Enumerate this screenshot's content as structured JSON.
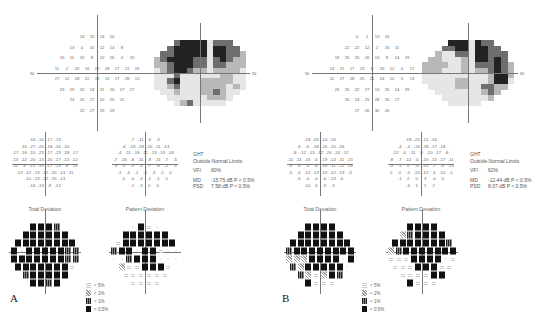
{
  "panels": [
    {
      "letter": "A",
      "offset_x": 0,
      "threshold": {
        "center": [
          97,
          73
        ],
        "axis_label_left": "30",
        "axis_label_right": "30",
        "rows": [
          [
            "14",
            "15",
            "14",
            "20"
          ],
          [
            "13",
            "4",
            "10",
            "12",
            "14",
            "8"
          ],
          [
            "15",
            "11",
            "15",
            "8",
            "12",
            "26",
            "4",
            "15"
          ],
          [
            "11",
            "2",
            "20",
            "16",
            "20",
            "18",
            "17",
            "21",
            "15"
          ],
          [
            "27",
            "12",
            "28",
            "22",
            "19",
            "15",
            "17",
            "28",
            "13"
          ],
          [
            "23",
            "19",
            "20",
            "24",
            "21",
            "16",
            "17",
            "27"
          ],
          [
            "24",
            "26",
            "27",
            "20",
            "25",
            "21"
          ],
          [
            "22",
            "27",
            "25",
            "29"
          ]
        ]
      },
      "grayscale": {
        "center": [
          200,
          73
        ],
        "levels": [
          [
            0,
            0,
            0,
            3,
            4,
            4,
            4,
            4,
            1,
            3,
            3,
            3,
            0,
            0
          ],
          [
            0,
            0,
            3,
            4,
            4,
            4,
            4,
            4,
            1,
            4,
            4,
            3,
            3,
            0
          ],
          [
            0,
            3,
            3,
            4,
            4,
            4,
            4,
            4,
            1,
            4,
            4,
            3,
            3,
            2
          ],
          [
            2,
            3,
            4,
            4,
            4,
            4,
            3,
            3,
            1,
            3,
            4,
            3,
            2,
            2
          ],
          [
            2,
            2,
            3,
            4,
            4,
            4,
            3,
            3,
            1,
            3,
            3,
            2,
            2,
            2
          ],
          [
            1,
            2,
            3,
            4,
            4,
            3,
            2,
            2,
            1,
            2,
            2,
            2,
            2,
            1
          ],
          [
            1,
            1,
            1,
            3,
            1,
            1,
            1,
            1,
            1,
            1,
            2,
            2,
            1,
            1
          ],
          [
            1,
            1,
            3,
            4,
            1,
            1,
            1,
            2,
            2,
            2,
            2,
            2,
            1,
            1
          ],
          [
            1,
            1,
            2,
            3,
            1,
            1,
            1,
            2,
            2,
            2,
            2,
            1,
            2,
            1
          ],
          [
            0,
            1,
            1,
            2,
            1,
            1,
            1,
            2,
            2,
            3,
            2,
            1,
            1,
            0
          ],
          [
            0,
            0,
            1,
            1,
            1,
            1,
            1,
            1,
            2,
            2,
            2,
            1,
            0,
            0
          ],
          [
            0,
            0,
            0,
            1,
            2,
            3,
            1,
            1,
            1,
            1,
            1,
            0,
            0,
            0
          ]
        ]
      },
      "total_deviation_values": {
        "center": [
          45,
          162
        ],
        "rows": [
          [
            "-16",
            "-16",
            "-17",
            "-13"
          ],
          [
            "-16",
            "-27",
            "-20",
            "-18",
            "-16",
            "-20"
          ],
          [
            "-17",
            "-18",
            "-15",
            "-23",
            "-17",
            "-23",
            "-28",
            "-17"
          ],
          [
            "-15",
            "-22",
            "-20",
            "-13",
            "-20",
            "-17",
            "-13",
            "-12"
          ],
          [
            "-11",
            "-9",
            "-13",
            "-15",
            "-17",
            "-13",
            "-8",
            "-11"
          ],
          [
            "-13",
            "-12",
            "-13",
            "-12",
            "-20",
            "-13",
            "-11"
          ],
          [
            "-10",
            "-13",
            "-12",
            "-15",
            "-13"
          ],
          [
            "-16",
            "-13",
            "-8",
            "-12"
          ]
        ]
      },
      "pattern_deviation_values": {
        "center": [
          145,
          162
        ],
        "rows": [
          [
            "-7",
            "-11",
            "-6",
            "-3"
          ],
          [
            "-6",
            "-19",
            "-18",
            "-20",
            "-11",
            "-13"
          ],
          [
            "-4",
            "-11",
            "-18",
            "-11",
            "-13",
            "-19",
            "-18"
          ],
          [
            "-7",
            "-16",
            "-8",
            "-11",
            "-8",
            "-11",
            "-7",
            "-3"
          ],
          [
            "-3",
            "0",
            "-5",
            "-4",
            "-7",
            "-8",
            "-2",
            "-3"
          ],
          [
            "-1",
            "-4",
            "-1",
            "-3",
            "-3",
            "-1",
            "0"
          ],
          [
            "0",
            "-4",
            "-3",
            "-2",
            "-1",
            "-1"
          ],
          [
            "-1",
            "-3",
            "0",
            "0"
          ]
        ]
      },
      "total_deviation_label": "Total Deviation",
      "pattern_deviation_label": "Pattern Deviation",
      "total_deviation_symbols": {
        "center": [
          45,
          255
        ],
        "rows": [
          [
            4,
            4,
            4,
            3
          ],
          [
            4,
            4,
            4,
            4,
            4,
            4
          ],
          [
            4,
            4,
            4,
            4,
            4,
            4,
            4,
            4
          ],
          [
            4,
            0,
            4,
            4,
            4,
            4,
            4,
            3,
            3
          ],
          [
            4,
            4,
            4,
            4,
            4,
            4,
            4,
            3,
            3
          ],
          [
            4,
            4,
            4,
            4,
            4,
            4,
            4,
            1
          ],
          [
            3,
            4,
            4,
            4,
            4,
            4
          ],
          [
            4,
            4,
            3,
            4
          ]
        ]
      },
      "pattern_deviation_symbols": {
        "center": [
          145,
          255
        ],
        "rows": [
          [
            0,
            4,
            1,
            0
          ],
          [
            4,
            4,
            4,
            4,
            4,
            4
          ],
          [
            1,
            4,
            4,
            4,
            4,
            4,
            4,
            4
          ],
          [
            3,
            4,
            4,
            0,
            4,
            4,
            1,
            0,
            0
          ],
          [
            0,
            0,
            3,
            4,
            4,
            4,
            0,
            0,
            0
          ],
          [
            2,
            1,
            1,
            4,
            4,
            4,
            1
          ],
          [
            1,
            1,
            1,
            1,
            1,
            1
          ],
          [
            1,
            1,
            1,
            1
          ]
        ]
      },
      "stats": {
        "ght_label": "GHT",
        "ght_value": "Outside Normal Limits",
        "vfi_label": "VFI",
        "vfi_value": "60%",
        "md_label": "MD",
        "md_value": "-15.75 dB P < 0.5%",
        "psd_label": "PSD",
        "psd_value": "7.58 dB  P < 0.5%"
      },
      "stats_pos": [
        193,
        151
      ],
      "legend_pos": [
        86,
        281
      ]
    },
    {
      "letter": "B",
      "offset_x": 0,
      "threshold": {
        "center": [
          372,
          73
        ],
        "axis_label_left": "30",
        "axis_label_right": "30",
        "rows": [
          [
            "0",
            "1",
            "13",
            "16"
          ],
          [
            "22",
            "22",
            "12",
            "2",
            "15",
            "11"
          ],
          [
            "19",
            "26",
            "26",
            "26",
            "13",
            "8",
            "14",
            "19"
          ],
          [
            "14",
            "21",
            "17",
            "23",
            "8",
            "20",
            "12",
            "4",
            "17"
          ],
          [
            "22",
            "27",
            "28",
            "25",
            "21",
            "24",
            "22",
            "5",
            "13"
          ],
          [
            "25",
            "26",
            "22",
            "27",
            "13",
            "26",
            "14",
            "29"
          ],
          [
            "26",
            "24",
            "25",
            "28",
            "26",
            "27"
          ],
          [
            "27",
            "26",
            "30",
            "26"
          ]
        ]
      },
      "grayscale": {
        "center": [
          468,
          73
        ],
        "levels": [
          [
            0,
            0,
            0,
            0,
            4,
            4,
            4,
            1,
            4,
            3,
            3,
            0,
            0,
            0
          ],
          [
            0,
            0,
            0,
            3,
            3,
            4,
            4,
            1,
            4,
            4,
            3,
            3,
            0,
            0
          ],
          [
            0,
            0,
            2,
            1,
            1,
            3,
            3,
            1,
            4,
            4,
            3,
            3,
            3,
            0
          ],
          [
            0,
            2,
            2,
            1,
            1,
            1,
            2,
            1,
            4,
            4,
            3,
            4,
            3,
            0
          ],
          [
            2,
            2,
            2,
            2,
            1,
            1,
            2,
            1,
            3,
            3,
            3,
            4,
            3,
            2
          ],
          [
            2,
            2,
            2,
            1,
            1,
            1,
            2,
            1,
            2,
            2,
            3,
            4,
            3,
            2
          ],
          [
            1,
            1,
            1,
            1,
            1,
            1,
            1,
            1,
            1,
            1,
            2,
            4,
            4,
            2
          ],
          [
            1,
            1,
            1,
            1,
            1,
            2,
            2,
            1,
            1,
            1,
            2,
            4,
            4,
            1
          ],
          [
            0,
            1,
            1,
            1,
            1,
            2,
            2,
            1,
            1,
            3,
            3,
            2,
            2,
            0
          ],
          [
            0,
            0,
            1,
            1,
            1,
            1,
            1,
            1,
            1,
            2,
            3,
            2,
            0,
            0
          ],
          [
            0,
            0,
            0,
            1,
            1,
            1,
            1,
            1,
            1,
            1,
            2,
            0,
            0,
            0
          ],
          [
            0,
            0,
            0,
            0,
            1,
            1,
            1,
            1,
            1,
            0,
            0,
            0,
            0,
            0
          ]
        ]
      },
      "total_deviation_values": {
        "center": [
          320,
          162
        ],
        "rows": [
          [
            "-18",
            "-26",
            "-14",
            "-16"
          ],
          [
            "-5",
            "-6",
            "-18",
            "-26",
            "-15",
            "-26"
          ],
          [
            "-8",
            "-12",
            "-13",
            "-12",
            "-26",
            "-24",
            "-12"
          ],
          [
            "-11",
            "-11",
            "-16",
            "-6",
            "-19",
            "-14",
            "-11",
            "-15"
          ],
          [
            "-6",
            "-6",
            "-4",
            "-6",
            "-10",
            "-11",
            "-12",
            "-26"
          ],
          [
            "-5",
            "-6",
            "-12",
            "-13",
            "-16",
            "-12",
            "-13",
            "-3"
          ],
          [
            "-5",
            "-4",
            "-4",
            "-6",
            "-13",
            "-6"
          ],
          [
            "-10",
            "-5",
            "-5",
            "-3"
          ]
        ]
      },
      "pattern_deviation_values": {
        "center": [
          421,
          162
        ],
        "rows": [
          [
            "-18",
            "-20",
            "-12",
            "-16"
          ],
          [
            "-4",
            "-4",
            "-16",
            "-28",
            "-17",
            "-18"
          ],
          [
            "-12",
            "-4",
            "-11",
            "-8",
            "-20",
            "-17",
            "-8"
          ],
          [
            "-8",
            "-7",
            "-12",
            "-6",
            "-15",
            "-15",
            "-17",
            "-11"
          ],
          [
            "-4",
            "-1",
            "0",
            "-6",
            "-10",
            "-7",
            "-6",
            "-15"
          ],
          [
            "0",
            "0",
            "-5",
            "-10",
            "-12",
            "-6",
            "-10",
            "-1"
          ],
          [
            "-1",
            "2",
            "0",
            "3",
            "-4",
            "-5"
          ],
          [
            "-6",
            "1",
            "1",
            "2"
          ]
        ]
      },
      "total_deviation_label": "Total Deviation",
      "pattern_deviation_label": "Pattern Deviation",
      "total_deviation_symbols": {
        "center": [
          320,
          255
        ],
        "rows": [
          [
            4,
            4,
            4,
            4
          ],
          [
            4,
            4,
            4,
            4,
            4,
            4
          ],
          [
            4,
            4,
            4,
            4,
            4,
            4,
            4,
            4
          ],
          [
            3,
            4,
            4,
            4,
            4,
            4,
            4,
            4,
            4
          ],
          [
            2,
            2,
            2,
            4,
            4,
            4,
            4,
            0,
            4
          ],
          [
            3,
            2,
            4,
            4,
            4,
            4,
            4,
            0
          ],
          [
            3,
            2,
            1,
            2,
            4,
            3
          ],
          [
            4,
            1,
            1,
            1
          ]
        ]
      },
      "pattern_deviation_symbols": {
        "center": [
          422,
          255
        ],
        "rows": [
          [
            4,
            4,
            4,
            4
          ],
          [
            2,
            3,
            4,
            4,
            4,
            4
          ],
          [
            4,
            4,
            4,
            4,
            4,
            4,
            4,
            3
          ],
          [
            2,
            3,
            4,
            4,
            4,
            4,
            4,
            4,
            4
          ],
          [
            1,
            1,
            1,
            4,
            4,
            4,
            4,
            0,
            1
          ],
          [
            1,
            1,
            1,
            4,
            4,
            4,
            1,
            1
          ],
          [
            1,
            1,
            1,
            1,
            4,
            4
          ],
          [
            4,
            1,
            1,
            1
          ]
        ]
      },
      "stats": {
        "ght_label": "GHT",
        "ght_value": "Outside Normal Limits",
        "vfi_label": "VFI",
        "vfi_value": "62%",
        "md_label": "MD",
        "md_value": "-12.44 dB P < 0.5%",
        "psd_label": "PSD",
        "psd_value": "8.07 dB  P < 0.5%"
      },
      "stats_pos": [
        470,
        151
      ],
      "legend_pos": [
        362,
        281
      ]
    }
  ],
  "legend": [
    {
      "symbol": "s5",
      "label": "< 5%"
    },
    {
      "symbol": "s2",
      "label": "< 2%"
    },
    {
      "symbol": "s1",
      "label": "< 1%"
    },
    {
      "symbol": "s05",
      "label": "< 0.5%"
    }
  ],
  "gray_colors": [
    "#ffffff",
    "#e6e6e6",
    "#b8b8b8",
    "#6e6e6e",
    "#222222"
  ]
}
